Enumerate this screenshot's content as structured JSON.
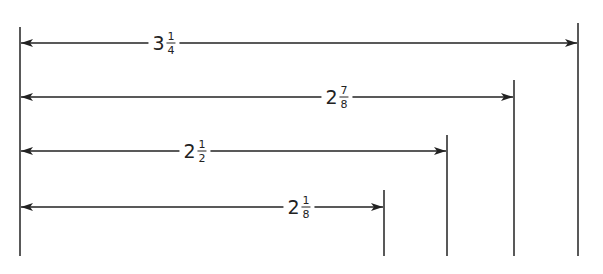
{
  "diagram": {
    "type": "dimension-lines",
    "line_color": "#222222",
    "background": "#ffffff",
    "baseline_x": 20,
    "bottom_y": 256,
    "dimensions": [
      {
        "id": "d1",
        "label_whole": "3",
        "label_num": "1",
        "label_den": "4",
        "value": 3.25,
        "arrow_y": 43,
        "end_x": 578,
        "top_y": 23,
        "label_x": 164
      },
      {
        "id": "d2",
        "label_whole": "2",
        "label_num": "7",
        "label_den": "8",
        "value": 2.875,
        "arrow_y": 97,
        "end_x": 514,
        "top_y": 80,
        "label_x": 337
      },
      {
        "id": "d3",
        "label_whole": "2",
        "label_num": "1",
        "label_den": "2",
        "value": 2.5,
        "arrow_y": 151,
        "end_x": 447,
        "top_y": 135,
        "label_x": 195
      },
      {
        "id": "d4",
        "label_whole": "2",
        "label_num": "1",
        "label_den": "8",
        "value": 2.125,
        "arrow_y": 207,
        "end_x": 384,
        "top_y": 190,
        "label_x": 299
      }
    ]
  }
}
